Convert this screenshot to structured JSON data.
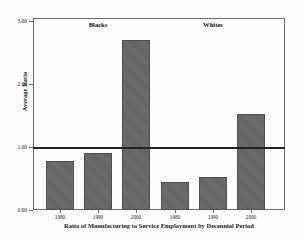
{
  "chart_data": {
    "type": "bar",
    "title": "",
    "xlabel": "Ratio of Manufacturing to Service Employment by Decennial Period",
    "ylabel": "Average Ratio",
    "ylim": [
      0.0,
      3.0
    ],
    "yticks": [
      "0.00",
      "1.00",
      "2.00",
      "3.00"
    ],
    "ytick_values": [
      0.0,
      1.0,
      2.0,
      3.0
    ],
    "grid": false,
    "legend": "none",
    "categories": [
      "1980",
      "1990",
      "2000",
      "1980",
      "1990",
      "2000"
    ],
    "values": [
      0.78,
      0.9,
      2.7,
      0.45,
      0.53,
      1.52
    ],
    "groups": [
      {
        "label": "Blacks",
        "categories": [
          "1980",
          "1990",
          "2000"
        ],
        "values": [
          0.78,
          0.9,
          2.7
        ]
      },
      {
        "label": "Whites",
        "categories": [
          "1980",
          "1990",
          "2000"
        ],
        "values": [
          0.45,
          0.53,
          1.52
        ]
      }
    ],
    "annotations": [
      {
        "name": "reference-line",
        "type": "hline",
        "value": 1.0,
        "label": ""
      }
    ],
    "bar_color": "#686868",
    "axis_color": "#6b6b6b",
    "reference_line_color": "#222222"
  },
  "figure": {
    "y_axis_title": "Average Ratio",
    "x_axis_title": "Ratio of Manufacturing to Service Employment by Decennial Period",
    "group_labels": [
      "Blacks",
      "Whites"
    ],
    "y_tick_labels": [
      "3.00",
      "2.00",
      "1.00",
      "0.00"
    ],
    "x_tick_labels": [
      "1980",
      "1990",
      "2000",
      "1980",
      "1990",
      "2000"
    ]
  }
}
